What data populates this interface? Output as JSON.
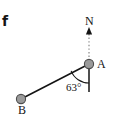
{
  "figure": {
    "panel_letter": "f",
    "width": 115,
    "height": 127,
    "background_color": "#ffffff"
  },
  "labels": {
    "north": "N",
    "point_a": "A",
    "point_b": "B",
    "bearing_angle": "63°"
  },
  "colors": {
    "line_stroke": "#141414",
    "marker_fill": "#9a9a9a",
    "marker_stroke": "#4d4d4d",
    "dashed_guide": "#a6a6a6",
    "text": "#141414"
  },
  "geometry": {
    "point_a": {
      "cx": 89,
      "cy": 64,
      "r": 4.6
    },
    "point_b": {
      "cx": 21,
      "cy": 99,
      "r": 4.6
    },
    "segment_ab": {
      "x1": 89,
      "y1": 64,
      "x2": 21,
      "y2": 99
    },
    "vertical_reference": {
      "x1": 89,
      "y1": 64,
      "x2": 89,
      "y2": 92
    },
    "north_guide_dashed": {
      "x1": 89,
      "y1": 34,
      "x2": 89,
      "y2": 60
    },
    "north_arrowhead": {
      "tip_x": 89,
      "tip_y": 27,
      "base_y": 34,
      "half_width": 3
    },
    "angle_arc": {
      "cx": 89,
      "cy": 64,
      "r": 19,
      "from": "segment-ab",
      "to": "vertical-reference"
    },
    "angle_value_degrees": 63
  }
}
